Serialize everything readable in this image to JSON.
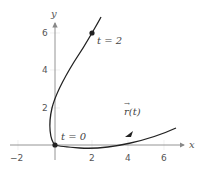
{
  "figure": {
    "axes": {
      "x_label": "x",
      "y_label": "y",
      "x_ticks": [
        {
          "value": -2,
          "label": "−2"
        },
        {
          "value": 2,
          "label": "2"
        },
        {
          "value": 4,
          "label": "4"
        },
        {
          "value": 6,
          "label": "6"
        }
      ],
      "y_ticks": [
        {
          "value": 2,
          "label": "2"
        },
        {
          "value": 4,
          "label": "4"
        },
        {
          "value": 6,
          "label": "6"
        }
      ]
    },
    "annotations": {
      "t0": "t = 0",
      "t2": "t = 2",
      "vector_fn": "r(t)",
      "vector_arrow": "→"
    },
    "points": [
      {
        "label": "t = 0",
        "x": 0,
        "y": 0
      },
      {
        "label": "t = 2",
        "x": 2,
        "y": 6
      }
    ],
    "colors": {
      "curve": "#222222",
      "axis": "#888888",
      "tick_text": "#555555"
    }
  }
}
